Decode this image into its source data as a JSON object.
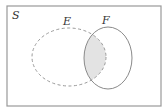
{
  "diagram": {
    "type": "venn",
    "universe": {
      "label": "S",
      "stroke": "#999999"
    },
    "sets": [
      {
        "label": "E",
        "style": "dashed",
        "stroke": "#9a9a9a"
      },
      {
        "label": "F",
        "style": "solid",
        "stroke": "#8a8a8a"
      }
    ],
    "shaded_region": {
      "description": "E ∩ F",
      "fill": "#e3e3e3"
    }
  }
}
